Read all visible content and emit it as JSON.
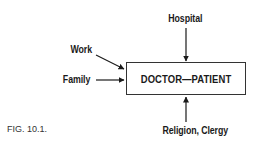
{
  "diagram": {
    "center_box": {
      "label": "DOCTOR—PATIENT"
    },
    "inputs": [
      {
        "label": "Hospital",
        "direction": "from-top"
      },
      {
        "label": "Work",
        "direction": "from-upper-left"
      },
      {
        "label": "Family",
        "direction": "from-left"
      },
      {
        "label": "Religion, Clergy",
        "direction": "from-bottom"
      }
    ],
    "caption": "FIG. 10.1."
  }
}
